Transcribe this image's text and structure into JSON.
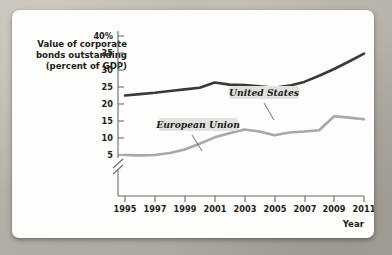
{
  "chart_data": {
    "type": "line",
    "title": "",
    "ylabel_lines": [
      "Value of corporate",
      "bonds outstanding",
      "(percent of GDP)"
    ],
    "xlabel": "Year",
    "x": [
      1995,
      1996,
      1997,
      1998,
      1999,
      2000,
      2001,
      2002,
      2003,
      2004,
      2005,
      2006,
      2007,
      2008,
      2009,
      2010,
      2011
    ],
    "xticks": [
      "1995",
      "1997",
      "1999",
      "2001",
      "2003",
      "2005",
      "2007",
      "2009",
      "2011"
    ],
    "xtick_values": [
      1995,
      1997,
      1999,
      2001,
      2003,
      2005,
      2007,
      2009,
      2011
    ],
    "yticks": [
      "5",
      "10",
      "15",
      "20",
      "25",
      "30",
      "35",
      "40%"
    ],
    "ytick_values": [
      5,
      10,
      15,
      20,
      25,
      30,
      35,
      40
    ],
    "ylim": [
      4,
      40
    ],
    "xlim": [
      1995,
      2011
    ],
    "axis_break": true,
    "grid": false,
    "legend_position": "inline-annotations",
    "series": [
      {
        "name": "United States",
        "color": "#3b3a38",
        "width": 2.6,
        "values": [
          22.5,
          22.9,
          23.3,
          23.8,
          24.3,
          24.8,
          26.3,
          25.7,
          25.6,
          25.2,
          24.8,
          25.4,
          26.5,
          28.3,
          30.3,
          32.5,
          34.8
        ]
      },
      {
        "name": "European Union",
        "color": "#a9a8a4",
        "width": 2.6,
        "values": [
          5.0,
          4.9,
          5.0,
          5.6,
          6.6,
          8.3,
          10.2,
          11.4,
          12.5,
          11.9,
          10.8,
          11.6,
          11.9,
          12.3,
          16.4,
          16.0,
          15.5
        ]
      }
    ],
    "annotations": [
      {
        "text": "United States",
        "x": 250,
        "y": 88,
        "leader_from": [
          244,
          95
        ],
        "leader_to": [
          255,
          110
        ]
      },
      {
        "text": "European Union",
        "x": 186,
        "y": 147,
        "leader_from": [
          181,
          154
        ],
        "leader_to": [
          191,
          167
        ]
      }
    ]
  },
  "colors": {
    "us_line": "#3b3a38",
    "eu_line": "#a9a8a4",
    "axis": "#6b6b6b",
    "text": "#1d1b19",
    "label_bg": "#e3e1dd",
    "card_bg": "#fdfdfc"
  }
}
